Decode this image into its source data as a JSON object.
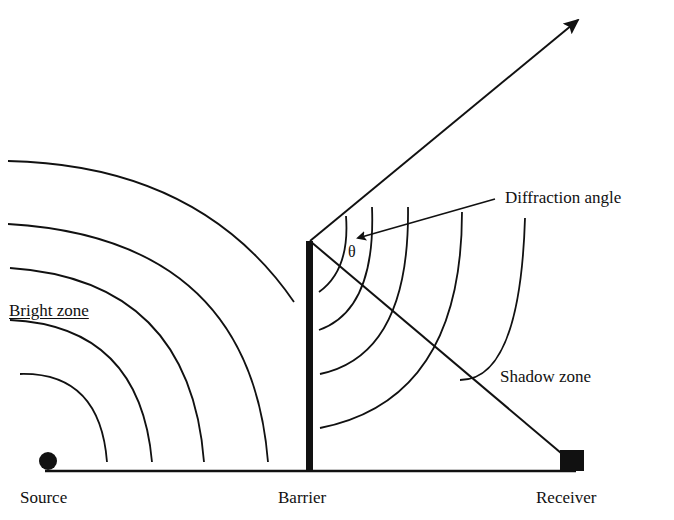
{
  "figure": {
    "labels": {
      "source": "Source",
      "barrier": "Barrier",
      "receiver": "Receiver",
      "bright_zone": "Bright zone",
      "shadow_zone": "Shadow zone",
      "diffraction_angle": "Diffraction angle",
      "theta": "θ"
    },
    "elements": {
      "source_marker": "filled-circle",
      "receiver_marker": "filled-square",
      "barrier": "thick-vertical-wall",
      "ground": "horizontal-line",
      "incident_waves": "concentric-arcs-from-source",
      "diffracted_waves": "concentric-arcs-from-barrier-top",
      "diffracted_ray": "arrow-from-barrier-top",
      "line_of_sight": "line-barrier-top-to-receiver"
    },
    "colors": {
      "ink": "#111111",
      "background": "#ffffff"
    }
  }
}
